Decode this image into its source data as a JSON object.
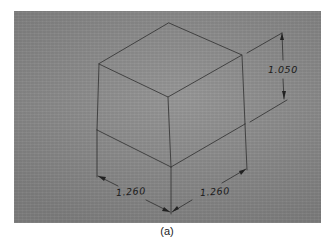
{
  "figure": {
    "caption": "(a)",
    "dimensions": {
      "height": "1.050",
      "left_width": "1.260",
      "right_width": "1.260"
    },
    "colors": {
      "paper": "#8a8a8a",
      "pencil": "#2a2a2a",
      "page": "#ffffff"
    }
  }
}
